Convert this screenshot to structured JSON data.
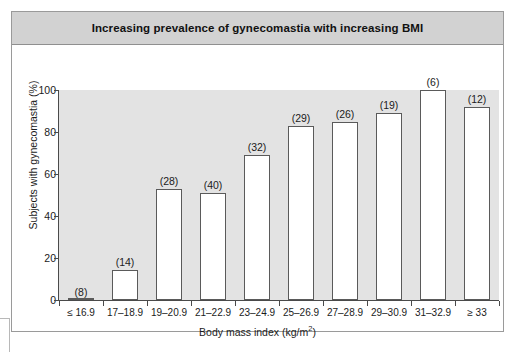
{
  "chart_data": {
    "type": "bar",
    "title": "Increasing prevalence of gynecomastia with increasing BMI",
    "xlabel": "Body mass index (kg/m2)",
    "xlabel_base": "Body mass index (kg/m",
    "xlabel_sup": "2",
    "xlabel_tail": ")",
    "ylabel": "Subjects with gynecomastia (%)",
    "ylim": [
      0,
      100
    ],
    "yticks": [
      0,
      20,
      40,
      60,
      80,
      100
    ],
    "ytick_labels": [
      "0",
      "20",
      "40",
      "60",
      "80",
      "100"
    ],
    "grid": false,
    "legend": "none",
    "categories": [
      "≤ 16.9",
      "17–18.9",
      "19–20.9",
      "21–22.9",
      "23–24.9",
      "25–26.9",
      "27–28.9",
      "29–30.9",
      "31–32.9",
      "≥ 33"
    ],
    "values": [
      0,
      14.5,
      53,
      51,
      69,
      83,
      85,
      89,
      100,
      92
    ],
    "point_labels": [
      "(8)",
      "(14)",
      "(28)",
      "(40)",
      "(32)",
      "(29)",
      "(26)",
      "(19)",
      "(6)",
      "(12)"
    ],
    "point_label_meaning": "number of subjects in group",
    "bar_fill_color": "#ffffff",
    "bar_edge_color": "#5a5a5a",
    "plot_bg_color": "#e3e3e3",
    "title_bar_color": "#d2d2d2",
    "axis_color": "#4a4a4a",
    "text_color": "#1b1b1b"
  }
}
